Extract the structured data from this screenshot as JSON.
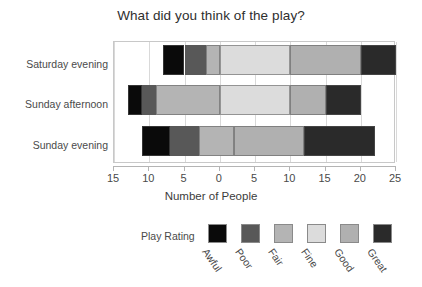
{
  "chart_data": {
    "type": "bar",
    "orientation": "horizontal",
    "stacked": true,
    "diverging": true,
    "title": "What did you think of the play?",
    "xlabel": "Number of People",
    "ylabel": "",
    "categories": [
      "Saturday evening",
      "Sunday afternoon",
      "Sunday evening"
    ],
    "legend_title": "Play Rating",
    "legend_position": "bottom",
    "grid": true,
    "xlim": [
      -15,
      25
    ],
    "xticks": [
      -15,
      -10,
      -5,
      0,
      5,
      10,
      15,
      20,
      25
    ],
    "xtick_labels": [
      "15",
      "10",
      "5",
      "0",
      "5",
      "10",
      "15",
      "20",
      "25"
    ],
    "series": [
      {
        "name": "Awful",
        "color": "#0a0a0a",
        "values": [
          3,
          2,
          4
        ]
      },
      {
        "name": "Poor",
        "color": "#585858",
        "values": [
          3,
          2,
          4
        ]
      },
      {
        "name": "Fair",
        "color": "#b4b4b4",
        "values": [
          2,
          9,
          5
        ]
      },
      {
        "name": "Fine",
        "color": "#dcdcdc",
        "values": [
          10,
          10,
          0
        ]
      },
      {
        "name": "Good",
        "color": "#b0b0b0",
        "values": [
          10,
          5,
          10
        ]
      },
      {
        "name": "Great",
        "color": "#2a2a2a",
        "values": [
          5,
          5,
          10
        ]
      }
    ],
    "bar_starts": [
      -8,
      -13,
      -11
    ],
    "bar_ends": [
      25,
      20,
      25
    ]
  },
  "axis": {
    "tick_labels": [
      "15",
      "10",
      "5",
      "0",
      "5",
      "10",
      "15",
      "20",
      "25"
    ],
    "tick_values": [
      -15,
      -10,
      -5,
      0,
      5,
      10,
      15,
      20,
      25
    ],
    "title": "Number of People"
  },
  "categories": [
    {
      "label": "Saturday evening"
    },
    {
      "label": "Sunday afternoon"
    },
    {
      "label": "Sunday evening"
    }
  ],
  "legend": {
    "title": "Play Rating",
    "items": [
      {
        "label": "Awful",
        "color": "#0a0a0a"
      },
      {
        "label": "Poor",
        "color": "#585858"
      },
      {
        "label": "Fair",
        "color": "#b4b4b4"
      },
      {
        "label": "Fine",
        "color": "#dcdcdc"
      },
      {
        "label": "Good",
        "color": "#b0b0b0"
      },
      {
        "label": "Great",
        "color": "#2a2a2a"
      }
    ]
  }
}
